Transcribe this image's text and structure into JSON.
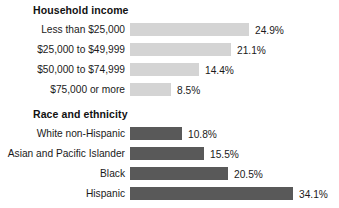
{
  "chart_data": {
    "type": "bar",
    "title": "",
    "orientation": "horizontal",
    "xlabel": "",
    "ylabel": "",
    "grid": false,
    "legend": "none",
    "axis_max_percent": 34.1,
    "groups": [
      {
        "title": "Household income",
        "bar_color": "#d4d4d4",
        "categories": [
          "Less than $25,000",
          "$25,000 to $49,999",
          "$50,000 to $74,999",
          "$75,000 or more"
        ],
        "values": [
          24.9,
          21.1,
          14.4,
          8.5
        ],
        "value_labels": [
          "24.9%",
          "21.1%",
          "14.4%",
          "8.5%"
        ]
      },
      {
        "title": "Race and ethnicity",
        "bar_color": "#595959",
        "categories": [
          "White non-Hispanic",
          "Asian and Pacific Islander",
          "Black",
          "Hispanic"
        ],
        "values": [
          10.8,
          15.5,
          20.5,
          34.1
        ],
        "value_labels": [
          "10.8%",
          "15.5%",
          "20.5%",
          "34.1%"
        ]
      }
    ]
  }
}
